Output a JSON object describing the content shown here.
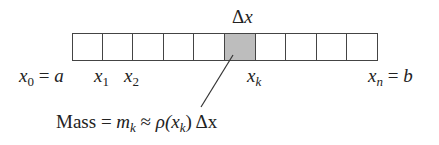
{
  "diagram": {
    "top_label": "Δx",
    "cell_count": 10,
    "shaded_index": 5,
    "shaded_color": "#bdbdbd",
    "bar": {
      "left": 72,
      "right": 378,
      "top": 33,
      "bottom": 61
    },
    "labels": {
      "x0_var": "x",
      "x0_sub": "0",
      "x0_eq": " = ",
      "x0_val": "a",
      "x1_var": "x",
      "x1_sub": "1",
      "x2_var": "x",
      "x2_sub": "2",
      "xk_var": "x",
      "xk_sub": "k",
      "xn_var": "x",
      "xn_sub": "n",
      "xn_eq": " = ",
      "xn_val": "b"
    },
    "formula": {
      "mass": "Mass",
      "eq": " = ",
      "m": "m",
      "m_sub": "k",
      "approx": " ≈ ",
      "rho": "ρ(x",
      "rho_sub": "k",
      "close": ")",
      "dx": " Δx"
    }
  }
}
